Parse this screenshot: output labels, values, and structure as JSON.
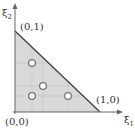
{
  "diagram": {
    "colors": {
      "fill": "#d9d9d9",
      "edge": "#444444",
      "axis": "#666666",
      "grid": "#bfbfbf",
      "point_fill": "#ffffff",
      "point_stroke": "#777777"
    },
    "axes": {
      "x_label": "ξ",
      "x_sub": "1",
      "y_label": "ξ",
      "y_sub": "2"
    },
    "vertices": [
      {
        "label": "(0,0)"
      },
      {
        "label": "(1,0)"
      },
      {
        "label": "(0,1)"
      }
    ],
    "points": [
      {
        "name": "point-1",
        "xi1": 0.2,
        "xi2": 0.6
      },
      {
        "name": "point-2",
        "xi1": 0.333,
        "xi2": 0.333
      },
      {
        "name": "point-3",
        "xi1": 0.2,
        "xi2": 0.2
      },
      {
        "name": "point-4",
        "xi1": 0.6,
        "xi2": 0.2
      }
    ]
  }
}
